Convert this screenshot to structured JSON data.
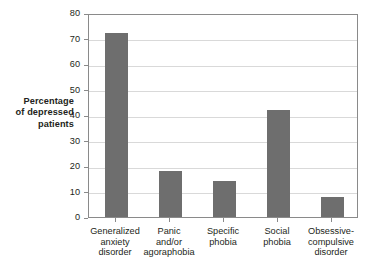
{
  "chart_data": {
    "type": "bar",
    "title": "",
    "xlabel": "",
    "ylabel": "Percentage of depressed patients",
    "ylim": [
      0,
      80
    ],
    "yticks": [
      0,
      10,
      20,
      30,
      40,
      50,
      60,
      70,
      80
    ],
    "grid": true,
    "legend": false,
    "categories": [
      "Generalized anxiety disorder",
      "Panic and/or agoraphobia",
      "Specific phobia",
      "Social phobia",
      "Obsessive-compulsive disorder"
    ],
    "category_lines": [
      [
        "Generalized",
        "anxiety",
        "disorder"
      ],
      [
        "Panic",
        "and/or",
        "agoraphobia"
      ],
      [
        "Specific",
        "phobia"
      ],
      [
        "Social",
        "phobia"
      ],
      [
        "Obsessive-",
        "compulsive",
        "disorder"
      ]
    ],
    "values": [
      72,
      18,
      14,
      42,
      8
    ],
    "bar_color": "#6e6e6e",
    "grid_color": "#d9d9d9",
    "axis_color": "#8a8a8a",
    "text_color": "#231f20"
  },
  "axis": {
    "y_title_lines": [
      "Percentage",
      "of depressed",
      "patients"
    ],
    "y_tick_labels": [
      "0",
      "10",
      "20",
      "30",
      "40",
      "50",
      "60",
      "70",
      "80"
    ]
  }
}
